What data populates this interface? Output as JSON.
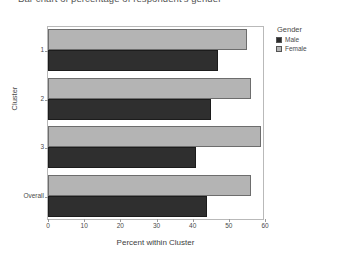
{
  "chart_title": "Bar chart of percentage of respondent's gender",
  "legend": {
    "title": "Gender",
    "entries": [
      {
        "label": "Male",
        "swatch": "male-swatch",
        "color": "#2f2f2f"
      },
      {
        "label": "Female",
        "swatch": "female-swatch",
        "color": "#b4b4b4"
      }
    ],
    "position": "right"
  },
  "chart_data": {
    "type": "bar",
    "orientation": "horizontal",
    "title": "Bar chart of percentage of respondent's gender",
    "xlabel": "Percent within Cluster",
    "ylabel": "Cluster",
    "categories": [
      "1",
      "2",
      "3",
      "Overall"
    ],
    "series": [
      {
        "name": "Male",
        "color": "#2f2f2f",
        "values": [
          47,
          45,
          41,
          44
        ]
      },
      {
        "name": "Female",
        "color": "#b4b4b4",
        "values": [
          55,
          56,
          59,
          56
        ]
      }
    ],
    "xlim": [
      0,
      60
    ],
    "xticks": [
      0,
      10,
      20,
      30,
      40,
      50,
      60
    ],
    "xtick_labels": [
      "0",
      "10",
      "20",
      "30",
      "40",
      "50",
      "60"
    ],
    "grid": false,
    "legend_position": "right"
  }
}
